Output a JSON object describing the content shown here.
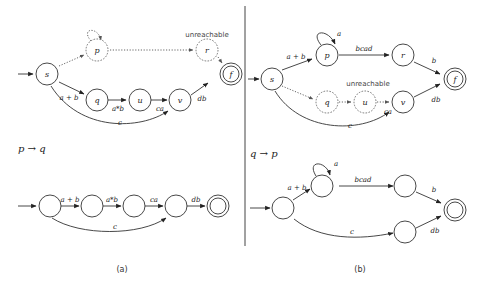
{
  "figure": {
    "panel_a": {
      "caption": "(a)",
      "top_graph": {
        "states": [
          {
            "id": "s",
            "label": "s",
            "style": "normal",
            "start": true
          },
          {
            "id": "p",
            "label": "p",
            "style": "dotted"
          },
          {
            "id": "r",
            "label": "r",
            "style": "dotted"
          },
          {
            "id": "f",
            "label": "f",
            "style": "final"
          },
          {
            "id": "q",
            "label": "q",
            "style": "normal"
          },
          {
            "id": "u",
            "label": "u",
            "style": "normal"
          },
          {
            "id": "v",
            "label": "v",
            "style": "normal"
          }
        ],
        "edges": [
          {
            "from": "s",
            "to": "p",
            "label": "",
            "style": "dotted"
          },
          {
            "from": "p",
            "to": "p",
            "label": "",
            "style": "dotted"
          },
          {
            "from": "p",
            "to": "r",
            "label": "",
            "style": "dotted"
          },
          {
            "from": "r",
            "to": "f",
            "label": "",
            "style": "dotted"
          },
          {
            "from": "s",
            "to": "q",
            "label": "a + b"
          },
          {
            "from": "q",
            "to": "u",
            "label": "a*b"
          },
          {
            "from": "u",
            "to": "v",
            "label": "ca"
          },
          {
            "from": "v",
            "to": "f",
            "label": "db"
          },
          {
            "from": "s",
            "to": "v",
            "label": "c"
          }
        ],
        "annotation": "unreachable"
      },
      "transform_label": "p → q",
      "bottom_graph": {
        "edges": [
          {
            "label": "a + b"
          },
          {
            "label": "a*b"
          },
          {
            "label": "ca"
          },
          {
            "label": "db"
          },
          {
            "label": "c"
          }
        ]
      }
    },
    "panel_b": {
      "caption": "(b)",
      "top_graph": {
        "states": [
          {
            "id": "s",
            "label": "s",
            "style": "normal",
            "start": true
          },
          {
            "id": "p",
            "label": "p",
            "style": "normal"
          },
          {
            "id": "r",
            "label": "r",
            "style": "normal"
          },
          {
            "id": "f",
            "label": "f",
            "style": "final"
          },
          {
            "id": "q",
            "label": "q",
            "style": "dotted"
          },
          {
            "id": "u",
            "label": "u",
            "style": "dotted"
          },
          {
            "id": "v",
            "label": "v",
            "style": "normal"
          }
        ],
        "edges": [
          {
            "from": "s",
            "to": "p",
            "label": "a + b"
          },
          {
            "from": "p",
            "to": "p",
            "label": "a"
          },
          {
            "from": "p",
            "to": "r",
            "label": "bcad"
          },
          {
            "from": "r",
            "to": "f",
            "label": "b"
          },
          {
            "from": "s",
            "to": "q",
            "label": "",
            "style": "dotted"
          },
          {
            "from": "q",
            "to": "u",
            "label": "",
            "style": "dotted"
          },
          {
            "from": "u",
            "to": "v",
            "label": "ca",
            "style": "dotted"
          },
          {
            "from": "v",
            "to": "f",
            "label": "db"
          },
          {
            "from": "s",
            "to": "v",
            "label": "c"
          }
        ],
        "annotation": "unreachable"
      },
      "transform_label": "q → p",
      "bottom_graph": {
        "edges": [
          {
            "label": "a + b"
          },
          {
            "label": "a"
          },
          {
            "label": "bcad"
          },
          {
            "label": "b"
          },
          {
            "label": "c"
          },
          {
            "label": "db"
          }
        ]
      }
    }
  }
}
